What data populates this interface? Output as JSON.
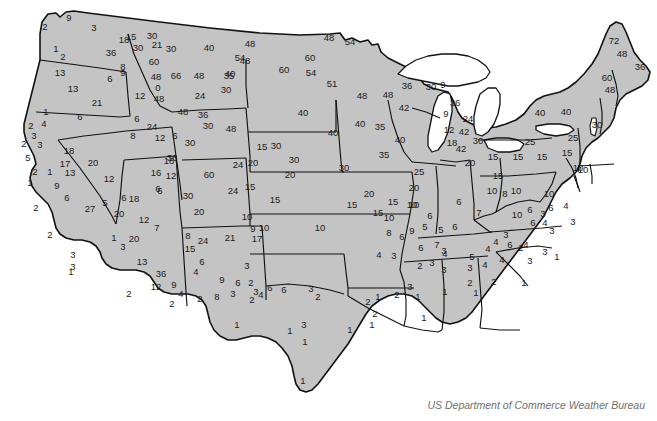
{
  "figure": {
    "title": "US Department of Commerce Weather Bureau",
    "caption": "US Department of Commerce Weather Bureau",
    "land_fill": "#c4c4c4",
    "land_stroke": "#111111",
    "background": "#ffffff",
    "label_color": "#1a1a1a",
    "caption_color": "#6f6f6f"
  },
  "chart_data": {
    "type": "map",
    "title": "US Department of Commerce Weather Bureau",
    "subtitle": "",
    "xlabel": "",
    "ylabel": "",
    "legend": [],
    "grid": false,
    "value_range": [
      0,
      72
    ],
    "units": "",
    "point_count": 233,
    "points": [
      {
        "label": "2",
        "x": 45,
        "y": 27
      },
      {
        "label": "9",
        "x": 69,
        "y": 18
      },
      {
        "label": "3",
        "x": 94,
        "y": 28
      },
      {
        "label": "15",
        "x": 131,
        "y": 37
      },
      {
        "label": "1",
        "x": 56,
        "y": 49
      },
      {
        "label": "36",
        "x": 111,
        "y": 53
      },
      {
        "label": "21",
        "x": 157,
        "y": 45
      },
      {
        "label": "2",
        "x": 63,
        "y": 57
      },
      {
        "label": "13",
        "x": 60,
        "y": 73
      },
      {
        "label": "8",
        "x": 123,
        "y": 67
      },
      {
        "label": "6",
        "x": 110,
        "y": 79
      },
      {
        "label": "13",
        "x": 73,
        "y": 89
      },
      {
        "label": "21",
        "x": 97,
        "y": 103
      },
      {
        "label": "1",
        "x": 46,
        "y": 112
      },
      {
        "label": "6",
        "x": 80,
        "y": 117
      },
      {
        "label": "18",
        "x": 124,
        "y": 40
      },
      {
        "label": "9",
        "x": 123,
        "y": 73
      },
      {
        "label": "12",
        "x": 140,
        "y": 96
      },
      {
        "label": "6",
        "x": 137,
        "y": 119
      },
      {
        "label": "8",
        "x": 133,
        "y": 136
      },
      {
        "label": "24",
        "x": 152,
        "y": 127
      },
      {
        "label": "30",
        "x": 152,
        "y": 36
      },
      {
        "label": "30",
        "x": 138,
        "y": 48
      },
      {
        "label": "30",
        "x": 171,
        "y": 49
      },
      {
        "label": "60",
        "x": 154,
        "y": 62
      },
      {
        "label": "48",
        "x": 156,
        "y": 77
      },
      {
        "label": "66",
        "x": 176,
        "y": 76
      },
      {
        "label": "48",
        "x": 199,
        "y": 76
      },
      {
        "label": "0",
        "x": 158,
        "y": 88
      },
      {
        "label": "48",
        "x": 159,
        "y": 99
      },
      {
        "label": "24",
        "x": 200,
        "y": 96
      },
      {
        "label": "40",
        "x": 209,
        "y": 48
      },
      {
        "label": "54",
        "x": 240,
        "y": 58
      },
      {
        "label": "35",
        "x": 229,
        "y": 76
      },
      {
        "label": "30",
        "x": 226,
        "y": 90
      },
      {
        "label": "48",
        "x": 183,
        "y": 112
      },
      {
        "label": "36",
        "x": 203,
        "y": 115
      },
      {
        "label": "30",
        "x": 208,
        "y": 126
      },
      {
        "label": "48",
        "x": 231,
        "y": 129
      },
      {
        "label": "12",
        "x": 160,
        "y": 138
      },
      {
        "label": "6",
        "x": 175,
        "y": 136
      },
      {
        "label": "36",
        "x": 172,
        "y": 158
      },
      {
        "label": "30",
        "x": 190,
        "y": 143
      },
      {
        "label": "60",
        "x": 209,
        "y": 175
      },
      {
        "label": "18",
        "x": 169,
        "y": 161
      },
      {
        "label": "16",
        "x": 156,
        "y": 173
      },
      {
        "label": "12",
        "x": 171,
        "y": 176
      },
      {
        "label": "6",
        "x": 160,
        "y": 191
      },
      {
        "label": "30",
        "x": 188,
        "y": 196
      },
      {
        "label": "20",
        "x": 199,
        "y": 212
      },
      {
        "label": "24",
        "x": 233,
        "y": 191
      },
      {
        "label": "15",
        "x": 250,
        "y": 187
      },
      {
        "label": "15",
        "x": 275,
        "y": 200
      },
      {
        "label": "20",
        "x": 290,
        "y": 175
      },
      {
        "label": "30",
        "x": 294,
        "y": 160
      },
      {
        "label": "20",
        "x": 253,
        "y": 163
      },
      {
        "label": "15",
        "x": 262,
        "y": 147
      },
      {
        "label": "30",
        "x": 276,
        "y": 146
      },
      {
        "label": "24",
        "x": 238,
        "y": 165
      },
      {
        "label": "10",
        "x": 247,
        "y": 217
      },
      {
        "label": "9",
        "x": 253,
        "y": 229
      },
      {
        "label": "10",
        "x": 264,
        "y": 228
      },
      {
        "label": "10",
        "x": 320,
        "y": 228
      },
      {
        "label": "15",
        "x": 352,
        "y": 205
      },
      {
        "label": "20",
        "x": 369,
        "y": 194
      },
      {
        "label": "20",
        "x": 414,
        "y": 188
      },
      {
        "label": "25",
        "x": 419,
        "y": 172
      },
      {
        "label": "15",
        "x": 378,
        "y": 213
      },
      {
        "label": "10",
        "x": 412,
        "y": 205
      },
      {
        "label": "35",
        "x": 384,
        "y": 155
      },
      {
        "label": "30",
        "x": 344,
        "y": 168
      },
      {
        "label": "40",
        "x": 333,
        "y": 133
      },
      {
        "label": "35",
        "x": 380,
        "y": 127
      },
      {
        "label": "40",
        "x": 303,
        "y": 113
      },
      {
        "label": "40",
        "x": 360,
        "y": 124
      },
      {
        "label": "48",
        "x": 362,
        "y": 96
      },
      {
        "label": "48",
        "x": 388,
        "y": 95
      },
      {
        "label": "42",
        "x": 404,
        "y": 108
      },
      {
        "label": "40",
        "x": 400,
        "y": 140
      },
      {
        "label": "60",
        "x": 310,
        "y": 58
      },
      {
        "label": "54",
        "x": 311,
        "y": 73
      },
      {
        "label": "48",
        "x": 250,
        "y": 44
      },
      {
        "label": "48",
        "x": 245,
        "y": 61
      },
      {
        "label": "40",
        "x": 230,
        "y": 74
      },
      {
        "label": "60",
        "x": 284,
        "y": 70
      },
      {
        "label": "48",
        "x": 329,
        "y": 38
      },
      {
        "label": "51",
        "x": 332,
        "y": 84
      },
      {
        "label": "54",
        "x": 350,
        "y": 42
      },
      {
        "label": "36",
        "x": 407,
        "y": 86
      },
      {
        "label": "30",
        "x": 431,
        "y": 87
      },
      {
        "label": "9",
        "x": 443,
        "y": 85
      },
      {
        "label": "36",
        "x": 455,
        "y": 103
      },
      {
        "label": "9",
        "x": 446,
        "y": 114
      },
      {
        "label": "24",
        "x": 468,
        "y": 119
      },
      {
        "label": "12",
        "x": 449,
        "y": 130
      },
      {
        "label": "42",
        "x": 464,
        "y": 132
      },
      {
        "label": "18",
        "x": 452,
        "y": 143
      },
      {
        "label": "30",
        "x": 478,
        "y": 141
      },
      {
        "label": "42",
        "x": 461,
        "y": 149
      },
      {
        "label": "20",
        "x": 470,
        "y": 163
      },
      {
        "label": "15",
        "x": 493,
        "y": 157
      },
      {
        "label": "15",
        "x": 518,
        "y": 157
      },
      {
        "label": "15",
        "x": 542,
        "y": 157
      },
      {
        "label": "15",
        "x": 567,
        "y": 153
      },
      {
        "label": "25",
        "x": 573,
        "y": 138
      },
      {
        "label": "25",
        "x": 530,
        "y": 142
      },
      {
        "label": "40",
        "x": 540,
        "y": 113
      },
      {
        "label": "30",
        "x": 597,
        "y": 125
      },
      {
        "label": "40",
        "x": 566,
        "y": 112
      },
      {
        "label": "10",
        "x": 578,
        "y": 168
      },
      {
        "label": "10",
        "x": 583,
        "y": 170
      },
      {
        "label": "72",
        "x": 614,
        "y": 41
      },
      {
        "label": "48",
        "x": 622,
        "y": 54
      },
      {
        "label": "36",
        "x": 640,
        "y": 67
      },
      {
        "label": "60",
        "x": 607,
        "y": 78
      },
      {
        "label": "48",
        "x": 610,
        "y": 90
      },
      {
        "label": "15",
        "x": 498,
        "y": 176
      },
      {
        "label": "10",
        "x": 492,
        "y": 191
      },
      {
        "label": "10",
        "x": 516,
        "y": 191
      },
      {
        "label": "8",
        "x": 505,
        "y": 194
      },
      {
        "label": "10",
        "x": 549,
        "y": 194
      },
      {
        "label": "6",
        "x": 551,
        "y": 208
      },
      {
        "label": "4",
        "x": 566,
        "y": 206
      },
      {
        "label": "3",
        "x": 573,
        "y": 222
      },
      {
        "label": "6",
        "x": 530,
        "y": 210
      },
      {
        "label": "7",
        "x": 479,
        "y": 213
      },
      {
        "label": "6",
        "x": 455,
        "y": 227
      },
      {
        "label": "5",
        "x": 441,
        "y": 230
      },
      {
        "label": "6",
        "x": 459,
        "y": 202
      },
      {
        "label": "9",
        "x": 412,
        "y": 231
      },
      {
        "label": "8",
        "x": 389,
        "y": 233
      },
      {
        "label": "10",
        "x": 389,
        "y": 218
      },
      {
        "label": "15",
        "x": 393,
        "y": 202
      },
      {
        "label": "10",
        "x": 414,
        "y": 205
      },
      {
        "label": "6",
        "x": 402,
        "y": 237
      },
      {
        "label": "6",
        "x": 430,
        "y": 216
      },
      {
        "label": "5",
        "x": 425,
        "y": 227
      },
      {
        "label": "6",
        "x": 421,
        "y": 248
      },
      {
        "label": "7",
        "x": 437,
        "y": 245
      },
      {
        "label": "4",
        "x": 445,
        "y": 254
      },
      {
        "label": "3",
        "x": 432,
        "y": 263
      },
      {
        "label": "5",
        "x": 472,
        "y": 257
      },
      {
        "label": "4",
        "x": 488,
        "y": 249
      },
      {
        "label": "4",
        "x": 496,
        "y": 242
      },
      {
        "label": "3",
        "x": 506,
        "y": 235
      },
      {
        "label": "2",
        "x": 521,
        "y": 248
      },
      {
        "label": "10",
        "x": 517,
        "y": 215
      },
      {
        "label": "3",
        "x": 543,
        "y": 214
      },
      {
        "label": "6",
        "x": 533,
        "y": 223
      },
      {
        "label": "4",
        "x": 545,
        "y": 223
      },
      {
        "label": "3",
        "x": 552,
        "y": 231
      },
      {
        "label": "6",
        "x": 510,
        "y": 245
      },
      {
        "label": "4",
        "x": 526,
        "y": 245
      },
      {
        "label": "3",
        "x": 545,
        "y": 252
      },
      {
        "label": "1",
        "x": 557,
        "y": 257
      },
      {
        "label": "4",
        "x": 502,
        "y": 260
      },
      {
        "label": "3",
        "x": 530,
        "y": 261
      },
      {
        "label": "4",
        "x": 379,
        "y": 255
      },
      {
        "label": "3",
        "x": 394,
        "y": 256
      },
      {
        "label": "3",
        "x": 444,
        "y": 251
      },
      {
        "label": "4",
        "x": 485,
        "y": 265
      },
      {
        "label": "1",
        "x": 524,
        "y": 283
      },
      {
        "label": "2",
        "x": 420,
        "y": 266
      },
      {
        "label": "3",
        "x": 444,
        "y": 270
      },
      {
        "label": "3",
        "x": 470,
        "y": 268
      },
      {
        "label": "2",
        "x": 470,
        "y": 283
      },
      {
        "label": "2",
        "x": 494,
        "y": 282
      },
      {
        "label": "3",
        "x": 410,
        "y": 287
      },
      {
        "label": "2",
        "x": 397,
        "y": 295
      },
      {
        "label": "1",
        "x": 418,
        "y": 297
      },
      {
        "label": "1",
        "x": 445,
        "y": 292
      },
      {
        "label": "1",
        "x": 476,
        "y": 293
      },
      {
        "label": "1",
        "x": 378,
        "y": 297
      },
      {
        "label": "2",
        "x": 368,
        "y": 302
      },
      {
        "label": "8",
        "x": 188,
        "y": 236
      },
      {
        "label": "24",
        "x": 203,
        "y": 241
      },
      {
        "label": "21",
        "x": 230,
        "y": 238
      },
      {
        "label": "17",
        "x": 257,
        "y": 239
      },
      {
        "label": "15",
        "x": 190,
        "y": 249
      },
      {
        "label": "7",
        "x": 157,
        "y": 228
      },
      {
        "label": "1",
        "x": 114,
        "y": 238
      },
      {
        "label": "20",
        "x": 134,
        "y": 239
      },
      {
        "label": "3",
        "x": 123,
        "y": 247
      },
      {
        "label": "13",
        "x": 142,
        "y": 262
      },
      {
        "label": "36",
        "x": 161,
        "y": 274
      },
      {
        "label": "12",
        "x": 156,
        "y": 287
      },
      {
        "label": "9",
        "x": 174,
        "y": 285
      },
      {
        "label": "4",
        "x": 181,
        "y": 294
      },
      {
        "label": "2",
        "x": 172,
        "y": 304
      },
      {
        "label": "2",
        "x": 129,
        "y": 294
      },
      {
        "label": "6",
        "x": 202,
        "y": 262
      },
      {
        "label": "4",
        "x": 196,
        "y": 272
      },
      {
        "label": "9",
        "x": 222,
        "y": 280
      },
      {
        "label": "8",
        "x": 217,
        "y": 297
      },
      {
        "label": "3",
        "x": 233,
        "y": 294
      },
      {
        "label": "2",
        "x": 200,
        "y": 299
      },
      {
        "label": "3",
        "x": 247,
        "y": 266
      },
      {
        "label": "2",
        "x": 251,
        "y": 283
      },
      {
        "label": "6",
        "x": 270,
        "y": 288
      },
      {
        "label": "3",
        "x": 256,
        "y": 292
      },
      {
        "label": "2",
        "x": 252,
        "y": 300
      },
      {
        "label": "6",
        "x": 238,
        "y": 283
      },
      {
        "label": "4",
        "x": 261,
        "y": 295
      },
      {
        "label": "6",
        "x": 284,
        "y": 290
      },
      {
        "label": "3",
        "x": 311,
        "y": 289
      },
      {
        "label": "2",
        "x": 318,
        "y": 297
      },
      {
        "label": "1",
        "x": 237,
        "y": 325
      },
      {
        "label": "1",
        "x": 290,
        "y": 331
      },
      {
        "label": "3",
        "x": 304,
        "y": 325
      },
      {
        "label": "1",
        "x": 305,
        "y": 342
      },
      {
        "label": "1",
        "x": 350,
        "y": 330
      },
      {
        "label": "1",
        "x": 303,
        "y": 381
      },
      {
        "label": "2",
        "x": 375,
        "y": 314
      },
      {
        "label": "1",
        "x": 372,
        "y": 325
      },
      {
        "label": "1",
        "x": 424,
        "y": 318
      },
      {
        "label": "2",
        "x": 31,
        "y": 126
      },
      {
        "label": "4",
        "x": 44,
        "y": 124
      },
      {
        "label": "3",
        "x": 34,
        "y": 136
      },
      {
        "label": "2",
        "x": 24,
        "y": 144
      },
      {
        "label": "3",
        "x": 40,
        "y": 145
      },
      {
        "label": "5",
        "x": 28,
        "y": 158
      },
      {
        "label": "2",
        "x": 35,
        "y": 172
      },
      {
        "label": "1",
        "x": 50,
        "y": 172
      },
      {
        "label": "1",
        "x": 30,
        "y": 183
      },
      {
        "label": "9",
        "x": 57,
        "y": 186
      },
      {
        "label": "6",
        "x": 67,
        "y": 198
      },
      {
        "label": "2",
        "x": 36,
        "y": 208
      },
      {
        "label": "27",
        "x": 90,
        "y": 209
      },
      {
        "label": "5",
        "x": 105,
        "y": 203
      },
      {
        "label": "2",
        "x": 50,
        "y": 235
      },
      {
        "label": "3",
        "x": 73,
        "y": 255
      },
      {
        "label": "3",
        "x": 73,
        "y": 267
      },
      {
        "label": "1",
        "x": 71,
        "y": 272
      },
      {
        "label": "18",
        "x": 69,
        "y": 151
      },
      {
        "label": "17",
        "x": 65,
        "y": 164
      },
      {
        "label": "13",
        "x": 70,
        "y": 173
      },
      {
        "label": "20",
        "x": 93,
        "y": 163
      },
      {
        "label": "12",
        "x": 109,
        "y": 179
      },
      {
        "label": "6",
        "x": 124,
        "y": 198
      },
      {
        "label": "18",
        "x": 134,
        "y": 199
      },
      {
        "label": "6",
        "x": 158,
        "y": 189
      },
      {
        "label": "12",
        "x": 144,
        "y": 220
      },
      {
        "label": "20",
        "x": 119,
        "y": 214
      }
    ]
  }
}
